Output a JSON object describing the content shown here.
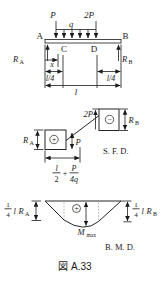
{
  "beam": {
    "label_p": "P",
    "label_q": "q",
    "label_2p": "2P",
    "node_a": "A",
    "node_b": "B",
    "node_c": "C",
    "node_d": "D",
    "reaction_left": {
      "base": "R",
      "sub": "A"
    },
    "reaction_right": {
      "base": "R",
      "sub": "B"
    },
    "dim_x": "x",
    "dim_quarter_left": "l/4",
    "dim_quarter_right": "l/4",
    "dim_total": "l"
  },
  "sfd": {
    "title": "S. F. D.",
    "reaction_left": {
      "base": "R",
      "sub": "A"
    },
    "reaction_right": {
      "base": "R",
      "sub": "B"
    },
    "step_p": "P",
    "step_2p": "2P",
    "sign_positive": "+",
    "sign_negative": "−",
    "zero_cross_dim": {
      "num1": "l",
      "den1": "2",
      "plus": "+",
      "num2": "P",
      "den2": "4q"
    }
  },
  "bmd": {
    "title": "B. M. D.",
    "moment_left": {
      "num": "1",
      "den": "4",
      "coef": "l",
      "base": "R",
      "sub": "A"
    },
    "moment_right": {
      "num": "1",
      "den": "4",
      "coef": "l",
      "base": "R",
      "sub": "B"
    },
    "m_max": {
      "base": "M",
      "sub": "max"
    },
    "sign_positive": "+"
  },
  "caption": "図 A.33",
  "colors": {
    "line": "#1a1a1a",
    "dotted": "#909090",
    "background": "#ffffff"
  }
}
